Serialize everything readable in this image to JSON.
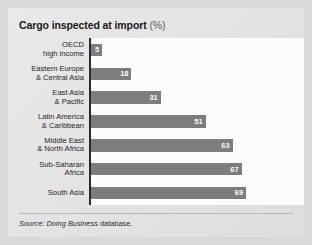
{
  "chart_data": {
    "type": "bar",
    "orientation": "horizontal",
    "title": "Cargo inspected at import",
    "title_unit": "(%)",
    "xlabel": "",
    "ylabel": "",
    "xlim": [
      0,
      69
    ],
    "grid": false,
    "legend": null,
    "bar_color": "#7d7d7d",
    "value_label_color": "#ffffff",
    "categories": [
      "OECD\nhigh income",
      "Eastern Europe\n& Central Asia",
      "East Asia\n& Pacific",
      "Latin America\n& Caribbean",
      "Middle East\n& North Africa",
      "Sub-Saharan\nAfrica",
      "South Asia"
    ],
    "values": [
      5,
      18,
      31,
      51,
      63,
      67,
      69
    ],
    "value_labels": [
      "5",
      "18",
      "31",
      "51",
      "63",
      "67",
      "69"
    ],
    "source": {
      "prefix": "Source: Doing Business",
      "suffix": " database."
    }
  }
}
